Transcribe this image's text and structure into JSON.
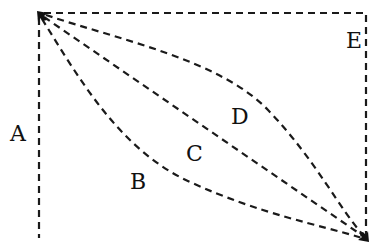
{
  "diagram": {
    "type": "path-comparison",
    "start_point": {
      "x": 39,
      "y": 13
    },
    "end_point": {
      "x": 367,
      "y": 240
    },
    "paths": [
      {
        "id": "A",
        "label": "A",
        "shape": "vertical-left-edge",
        "label_pos": {
          "x": 10,
          "y": 141
        }
      },
      {
        "id": "B",
        "label": "B",
        "shape": "curve-bulging-down-left",
        "label_pos": {
          "x": 130,
          "y": 189
        }
      },
      {
        "id": "C",
        "label": "C",
        "shape": "straight-diagonal",
        "label_pos": {
          "x": 186,
          "y": 161
        }
      },
      {
        "id": "D",
        "label": "D",
        "shape": "curve-bulging-up-right",
        "label_pos": {
          "x": 231,
          "y": 124
        }
      },
      {
        "id": "E",
        "label": "E",
        "shape": "top-edge-then-right-edge",
        "label_pos": {
          "x": 346,
          "y": 48
        }
      }
    ],
    "line_style": "dashed",
    "line_color": "#1a1a1a",
    "background": "#ffffff"
  },
  "labels": {
    "a": "A",
    "b": "B",
    "c": "C",
    "d": "D",
    "e": "E"
  }
}
